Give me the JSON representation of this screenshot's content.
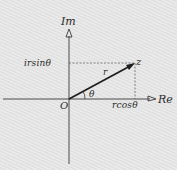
{
  "diagram": {
    "axes": {
      "imaginary_label": "Im",
      "real_label": "Re"
    },
    "origin_label": "O",
    "point_label": "z",
    "modulus_label": "r",
    "angle_label": "θ",
    "imaginary_component_label": "irsinθ",
    "real_component_label": "rcosθ",
    "colors": {
      "background": "#e4e4e4",
      "ink": "#2a2a2a"
    }
  }
}
